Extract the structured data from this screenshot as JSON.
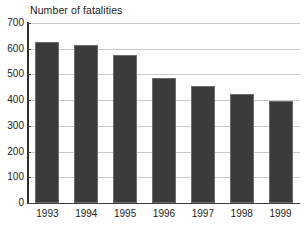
{
  "chart_data": {
    "type": "bar",
    "title": "Number of fatalities",
    "xlabel": "",
    "ylabel": "",
    "categories": [
      "1993",
      "1994",
      "1995",
      "1996",
      "1997",
      "1998",
      "1999"
    ],
    "values": [
      625,
      613,
      577,
      485,
      455,
      425,
      395
    ],
    "series": [
      {
        "name": "Number of fatalities",
        "values": [
          625,
          613,
          577,
          485,
          455,
          425,
          395
        ]
      }
    ],
    "ylim": [
      0,
      700
    ],
    "ytick_labels": [
      "700",
      "600",
      "500",
      "400",
      "300",
      "200",
      "100",
      "0"
    ],
    "ytick_values": [
      700,
      600,
      500,
      400,
      300,
      200,
      100,
      0
    ],
    "grid": true,
    "grid_axis": "y",
    "legend": false,
    "legend_position": "none",
    "bar_color": "#3b3b3b",
    "grid_color": "#c8c8c8",
    "axis_color": "#2e2e2e",
    "background_color": "#ffffff"
  }
}
